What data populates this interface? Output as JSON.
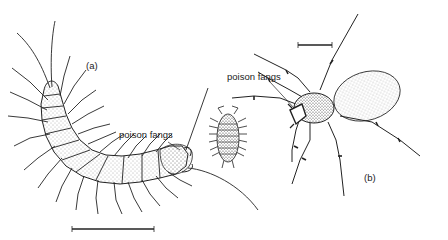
{
  "figure": {
    "labels": {
      "panel_a": "(a)",
      "panel_b": "(b)",
      "fangs_centipede": "poison fangs",
      "fangs_spider": "poison fangs"
    },
    "subjects": [
      "centipede",
      "woodlouse",
      "spider"
    ],
    "colors": {
      "ink": "#222222",
      "background": "#ffffff",
      "stipple": "#555555"
    }
  }
}
